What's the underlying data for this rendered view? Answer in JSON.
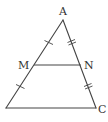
{
  "diagram": {
    "colors": {
      "stroke": "#444444",
      "label": "#333333",
      "background": "#ffffff"
    },
    "points": {
      "A": {
        "label": "A",
        "x": 63,
        "y": 20,
        "label_x": 59,
        "label_y": 15
      },
      "B": {
        "label": "",
        "x": 6,
        "y": 108
      },
      "C": {
        "label": "C",
        "x": 96,
        "y": 108,
        "label_x": 98,
        "label_y": 113
      },
      "M": {
        "label": "M",
        "x": 34.5,
        "y": 65,
        "label_x": 18,
        "label_y": 69
      },
      "N": {
        "label": "N",
        "x": 80.5,
        "y": 65,
        "label_x": 84,
        "label_y": 69
      }
    },
    "segments": [
      "AB",
      "AC",
      "BC",
      "MN"
    ],
    "tick_marks": [
      {
        "segment": "AM",
        "count": 1
      },
      {
        "segment": "MB",
        "count": 1
      },
      {
        "segment": "AN",
        "count": 2
      },
      {
        "segment": "NC",
        "count": 2
      }
    ]
  }
}
